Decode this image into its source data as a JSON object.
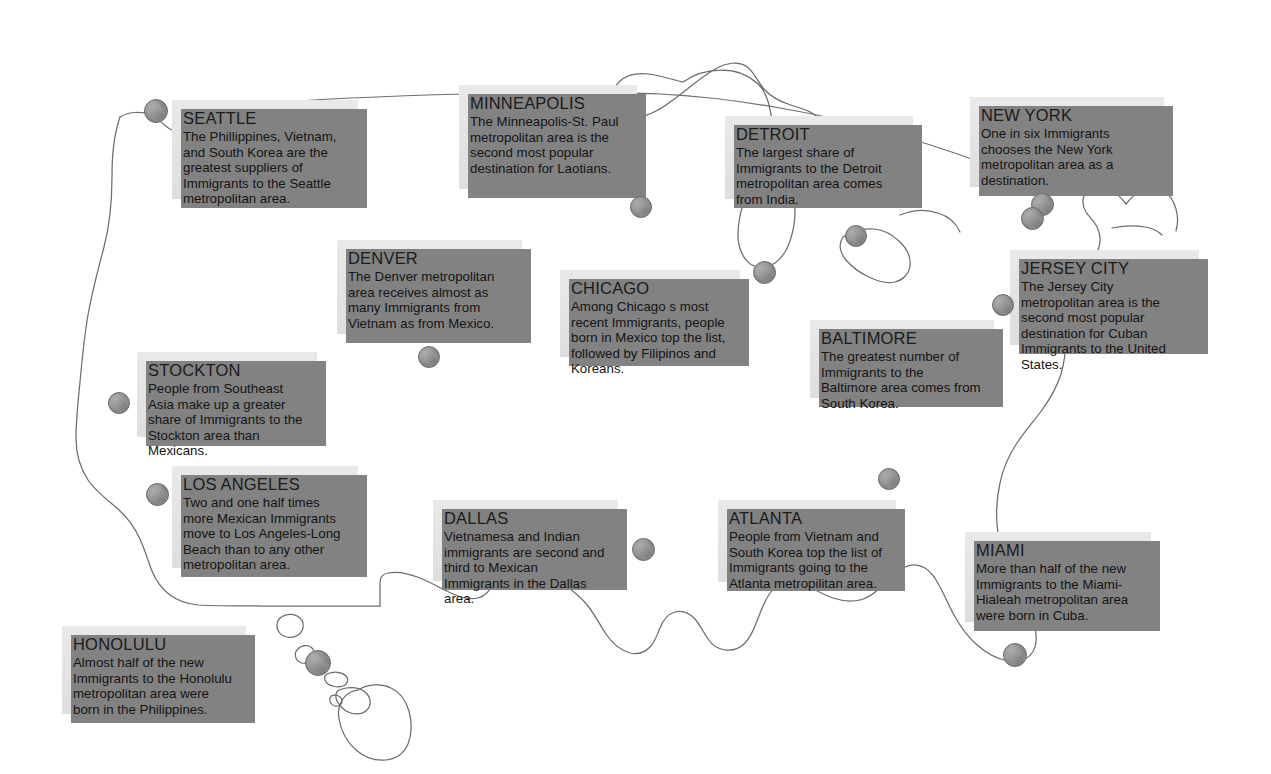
{
  "page": {
    "background_color": "#ffffff",
    "box_fill_color": "#e6e6e6",
    "box_shadow_color": "#828282",
    "dot_color": "#8f8f8f",
    "coastline_color": "#6d6d6d"
  },
  "callouts": [
    {
      "id": "seattle",
      "city": "SEATTLE",
      "text": "The Phillippines, Vietnam, and South Korea are the greatest suppliers of Immigrants to the Seattle metropolitan area.",
      "x": 172,
      "y": 100,
      "w": 186,
      "h": 99
    },
    {
      "id": "minneapolis",
      "city": "MINNEAPOLIS",
      "text": "The Minneapolis-St. Paul metropolitan area is the second most popular destination for Laotians.",
      "x": 459,
      "y": 85,
      "w": 178,
      "h": 104
    },
    {
      "id": "detroit",
      "city": "DETROIT",
      "text": "The largest share of Immigrants to the Detroit metropolitan area comes from India.",
      "x": 725,
      "y": 116,
      "w": 188,
      "h": 83
    },
    {
      "id": "new-york",
      "city": "NEW YORK",
      "text": "One in six Immigrants chooses the New York metropolitan area as a destination.",
      "x": 970,
      "y": 97,
      "w": 194,
      "h": 90
    },
    {
      "id": "denver",
      "city": "DENVER",
      "text": "The Denver metropolitan area receives almost as many Immigrants from Vietnam as from Mexico.",
      "x": 337,
      "y": 240,
      "w": 185,
      "h": 94
    },
    {
      "id": "chicago",
      "city": "CHICAGO",
      "text": "Among Chicago s most recent Immigrants, people born in Mexico top the list, followed by Filipinos and Koreans.",
      "x": 560,
      "y": 270,
      "w": 180,
      "h": 87
    },
    {
      "id": "jersey-city",
      "city": "JERSEY CITY",
      "text": "The Jersey City metropolitan area is the second most popular destination for Cuban Immigrants to the United States.",
      "x": 1010,
      "y": 250,
      "w": 189,
      "h": 95
    },
    {
      "id": "baltimore",
      "city": "BALTIMORE",
      "text": "The greatest number of Immigrants to the Baltimore area comes from South Korea.",
      "x": 810,
      "y": 320,
      "w": 184,
      "h": 78
    },
    {
      "id": "stockton",
      "city": "STOCKTON",
      "text": "People from Southeast Asia make up a greater share of Immigrants to the Stockton area than Mexicans.",
      "x": 137,
      "y": 352,
      "w": 180,
      "h": 85
    },
    {
      "id": "los-angeles",
      "city": "LOS ANGELES",
      "text": "Two and one half times more Mexican Immigrants move to Los Angeles-Long Beach than to any other metropolitan area.",
      "x": 172,
      "y": 466,
      "w": 186,
      "h": 102
    },
    {
      "id": "dallas",
      "city": "DALLAS",
      "text": "Vietnamesa and Indian immigrants are second and third to Mexican Immigrants in the Dallas area.",
      "x": 433,
      "y": 500,
      "w": 185,
      "h": 81
    },
    {
      "id": "atlanta",
      "city": "ATLANTA",
      "text": "People from Vietnam and South Korea top the list of Immigrants going to the Atlanta metropilitan area.",
      "x": 718,
      "y": 500,
      "w": 178,
      "h": 82
    },
    {
      "id": "miami",
      "city": "MIAMI",
      "text": "More than half of the new Immigrants to the Miami-Hialeah metropolitan area were born in Cuba.",
      "x": 965,
      "y": 532,
      "w": 186,
      "h": 90
    },
    {
      "id": "honolulu",
      "city": "HONOLULU",
      "text": "Almost half of the new Immigrants to the Honolulu metropolitan area were born in the Philippines.",
      "x": 62,
      "y": 626,
      "w": 184,
      "h": 88
    }
  ],
  "dots": [
    {
      "id": "dot-seattle",
      "x": 144,
      "y": 99,
      "size": 22
    },
    {
      "id": "dot-minneapolis",
      "x": 630,
      "y": 196,
      "size": 20
    },
    {
      "id": "dot-detroit",
      "x": 845,
      "y": 225,
      "size": 20
    },
    {
      "id": "dot-chicago",
      "x": 753,
      "y": 261,
      "size": 21
    },
    {
      "id": "dot-new-york",
      "x": 1021,
      "y": 207,
      "size": 21
    },
    {
      "id": "dot-newark",
      "x": 1031,
      "y": 193,
      "size": 21
    },
    {
      "id": "dot-jersey-city",
      "x": 992,
      "y": 294,
      "size": 20
    },
    {
      "id": "dot-denver",
      "x": 418,
      "y": 346,
      "size": 20
    },
    {
      "id": "dot-stockton",
      "x": 108,
      "y": 392,
      "size": 20
    },
    {
      "id": "dot-baltimore",
      "x": 878,
      "y": 468,
      "size": 20
    },
    {
      "id": "dot-los-angeles",
      "x": 146,
      "y": 483,
      "size": 21
    },
    {
      "id": "dot-dallas",
      "x": 632,
      "y": 538,
      "size": 21
    },
    {
      "id": "dot-honolulu",
      "x": 305,
      "y": 650,
      "size": 24
    },
    {
      "id": "dot-miami",
      "x": 1003,
      "y": 643,
      "size": 22
    }
  ]
}
